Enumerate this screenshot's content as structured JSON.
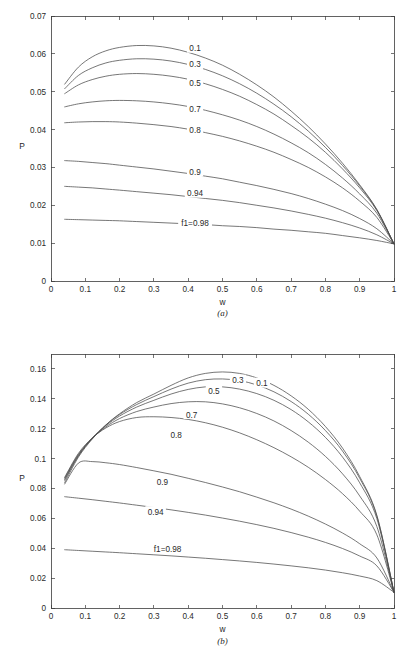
{
  "figure": {
    "panels": [
      {
        "id": "a",
        "caption": "(a)",
        "xlabel": "w",
        "ylabel": "P"
      },
      {
        "id": "b",
        "caption": "(b)",
        "xlabel": "w",
        "ylabel": "P"
      }
    ]
  },
  "chart_data": [
    {
      "type": "line",
      "panel": "(a)",
      "title": "",
      "xlabel": "w",
      "ylabel": "P",
      "xlim": [
        0,
        1
      ],
      "ylim": [
        0,
        0.07
      ],
      "xticks": [
        0,
        0.1,
        0.2,
        0.3,
        0.4,
        0.5,
        0.6,
        0.7,
        0.8,
        0.9,
        1
      ],
      "xticklabels": [
        "0",
        "0.1",
        "0.2",
        "0.3",
        "0.4",
        "0.5",
        "0.6",
        "0.7",
        "0.8",
        "0.9",
        "1"
      ],
      "yticks": [
        0,
        0.01,
        0.02,
        0.03,
        0.04,
        0.05,
        0.06,
        0.07
      ],
      "yticklabels": [
        "0",
        "0.01",
        "0.02",
        "0.03",
        "0.04",
        "0.05",
        "0.06",
        "0.07"
      ],
      "grid": false,
      "legend": "inline-curve-labels",
      "x": [
        0.04,
        0.08,
        0.12,
        0.16,
        0.2,
        0.25,
        0.3,
        0.35,
        0.4,
        0.45,
        0.5,
        0.55,
        0.6,
        0.65,
        0.7,
        0.75,
        0.8,
        0.85,
        0.9,
        0.95,
        1.0
      ],
      "series": [
        {
          "name": "0.1",
          "label": "0.1",
          "label_x": 0.42,
          "label_y": 0.0615,
          "values": [
            0.052,
            0.0565,
            0.0592,
            0.0608,
            0.0617,
            0.0622,
            0.0621,
            0.0615,
            0.0604,
            0.0589,
            0.057,
            0.0546,
            0.0518,
            0.0486,
            0.0449,
            0.0408,
            0.0362,
            0.0311,
            0.0254,
            0.0189,
            0.0098
          ]
        },
        {
          "name": "0.3",
          "label": "0.3",
          "label_x": 0.42,
          "label_y": 0.0572,
          "values": [
            0.0508,
            0.0543,
            0.0563,
            0.0576,
            0.0583,
            0.0587,
            0.0586,
            0.0581,
            0.0572,
            0.0559,
            0.0542,
            0.0521,
            0.0496,
            0.0467,
            0.0434,
            0.0396,
            0.0353,
            0.0305,
            0.0251,
            0.0188,
            0.0098
          ]
        },
        {
          "name": "0.5",
          "label": "0.5",
          "label_x": 0.42,
          "label_y": 0.0524,
          "values": [
            0.0495,
            0.0518,
            0.0532,
            0.0541,
            0.0546,
            0.0548,
            0.0546,
            0.0541,
            0.0533,
            0.0521,
            0.0506,
            0.0488,
            0.0466,
            0.0441,
            0.0411,
            0.0378,
            0.034,
            0.0296,
            0.0246,
            0.0186,
            0.0098
          ]
        },
        {
          "name": "0.7",
          "label": "0.7",
          "label_x": 0.42,
          "label_y": 0.0455,
          "values": [
            0.046,
            0.0468,
            0.0473,
            0.0476,
            0.0477,
            0.0476,
            0.0473,
            0.0468,
            0.0461,
            0.0451,
            0.0439,
            0.0425,
            0.0408,
            0.0388,
            0.0365,
            0.0339,
            0.0308,
            0.0272,
            0.023,
            0.0179,
            0.0098
          ]
        },
        {
          "name": "0.8",
          "label": "0.8",
          "label_x": 0.42,
          "label_y": 0.04,
          "values": [
            0.0418,
            0.042,
            0.0421,
            0.0421,
            0.042,
            0.0417,
            0.0413,
            0.0408,
            0.0401,
            0.0392,
            0.0382,
            0.037,
            0.0356,
            0.034,
            0.0321,
            0.03,
            0.0275,
            0.0246,
            0.0211,
            0.0168,
            0.0098
          ]
        },
        {
          "name": "0.9",
          "label": "0.9",
          "label_x": 0.42,
          "label_y": 0.0288,
          "values": [
            0.0318,
            0.0316,
            0.0313,
            0.031,
            0.0306,
            0.0301,
            0.0296,
            0.029,
            0.0284,
            0.0277,
            0.027,
            0.0261,
            0.0252,
            0.0242,
            0.0231,
            0.0218,
            0.0203,
            0.0186,
            0.0165,
            0.0138,
            0.0098
          ]
        },
        {
          "name": "0.94",
          "label": "0.94",
          "label_x": 0.42,
          "label_y": 0.0232,
          "values": [
            0.025,
            0.0248,
            0.0246,
            0.0243,
            0.024,
            0.0236,
            0.0232,
            0.0228,
            0.0223,
            0.0218,
            0.0213,
            0.0207,
            0.02,
            0.0193,
            0.0185,
            0.0176,
            0.0166,
            0.0154,
            0.014,
            0.0122,
            0.0098
          ]
        },
        {
          "name": "f1=0.98",
          "label": "f1=0.98",
          "label_x": 0.42,
          "label_y": 0.0152,
          "values": [
            0.0163,
            0.0162,
            0.0161,
            0.016,
            0.0159,
            0.0157,
            0.0155,
            0.0153,
            0.0151,
            0.0149,
            0.0146,
            0.0144,
            0.0141,
            0.0137,
            0.0134,
            0.013,
            0.0126,
            0.012,
            0.0114,
            0.0107,
            0.0098
          ]
        }
      ]
    },
    {
      "type": "line",
      "panel": "(b)",
      "title": "",
      "xlabel": "w",
      "ylabel": "P",
      "xlim": [
        0,
        1
      ],
      "ylim": [
        0,
        0.17
      ],
      "xticks": [
        0,
        0.1,
        0.2,
        0.3,
        0.4,
        0.5,
        0.6,
        0.7,
        0.8,
        0.9,
        1
      ],
      "xticklabels": [
        "0",
        "0.1",
        "0.2",
        "0.3",
        "0.4",
        "0.5",
        "0.6",
        "0.7",
        "0.8",
        "0.9",
        "1"
      ],
      "yticks": [
        0,
        0.02,
        0.04,
        0.06,
        0.08,
        0.1,
        0.12,
        0.14,
        0.16
      ],
      "yticklabels": [
        "0",
        "0.02",
        "0.04",
        "0.06",
        "0.08",
        "0.1",
        "0.12",
        "0.14",
        "0.16"
      ],
      "grid": false,
      "legend": "inline-curve-labels",
      "x": [
        0.04,
        0.08,
        0.12,
        0.16,
        0.2,
        0.25,
        0.3,
        0.35,
        0.4,
        0.45,
        0.5,
        0.55,
        0.6,
        0.65,
        0.7,
        0.75,
        0.8,
        0.85,
        0.9,
        0.95,
        1.0
      ],
      "series": [
        {
          "name": "0.1",
          "label": "0.1",
          "label_x": 0.615,
          "label_y": 0.1505,
          "values": [
            0.084,
            0.101,
            0.113,
            0.1225,
            0.13,
            0.1375,
            0.1432,
            0.149,
            0.154,
            0.157,
            0.158,
            0.157,
            0.154,
            0.149,
            0.142,
            0.133,
            0.1215,
            0.107,
            0.088,
            0.062,
            0.0105
          ]
        },
        {
          "name": "0.3",
          "label": "0.3",
          "label_x": 0.545,
          "label_y": 0.1525,
          "values": [
            0.0855,
            0.1018,
            0.1135,
            0.1225,
            0.1295,
            0.1362,
            0.1415,
            0.1465,
            0.1505,
            0.1528,
            0.1533,
            0.1522,
            0.1493,
            0.1447,
            0.1382,
            0.1297,
            0.1188,
            0.105,
            0.0868,
            0.0615,
            0.0105
          ]
        },
        {
          "name": "0.5",
          "label": "0.5",
          "label_x": 0.475,
          "label_y": 0.1455,
          "values": [
            0.0862,
            0.1022,
            0.1135,
            0.122,
            0.1285,
            0.1345,
            0.139,
            0.1432,
            0.1463,
            0.148,
            0.148,
            0.1465,
            0.1435,
            0.139,
            0.1328,
            0.1246,
            0.1142,
            0.101,
            0.0838,
            0.0598,
            0.0105
          ]
        },
        {
          "name": "0.7",
          "label": "0.7",
          "label_x": 0.41,
          "label_y": 0.1295,
          "values": [
            0.087,
            0.1028,
            0.1135,
            0.1212,
            0.1268,
            0.1315,
            0.1345,
            0.1368,
            0.138,
            0.138,
            0.1366,
            0.134,
            0.1302,
            0.1252,
            0.1188,
            0.111,
            0.1015,
            0.0898,
            0.075,
            0.0545,
            0.0105
          ]
        },
        {
          "name": "0.8",
          "label": "0.8",
          "label_x": 0.365,
          "label_y": 0.1155,
          "values": [
            0.0875,
            0.1035,
            0.1138,
            0.1205,
            0.1248,
            0.1275,
            0.128,
            0.1275,
            0.1262,
            0.124,
            0.121,
            0.1172,
            0.1126,
            0.1073,
            0.1012,
            0.0942,
            0.086,
            0.0765,
            0.0648,
            0.049,
            0.0105
          ]
        },
        {
          "name": "0.9",
          "label": "0.9",
          "label_x": 0.325,
          "label_y": 0.0845,
          "values": [
            0.083,
            0.097,
            0.098,
            0.0972,
            0.096,
            0.094,
            0.0918,
            0.0895,
            0.0868,
            0.084,
            0.081,
            0.0778,
            0.0742,
            0.0704,
            0.0662,
            0.0615,
            0.0562,
            0.0502,
            0.043,
            0.0335,
            0.0105
          ]
        },
        {
          "name": "0.94",
          "label": "0.94",
          "label_x": 0.305,
          "label_y": 0.0645,
          "values": [
            0.0745,
            0.0735,
            0.0725,
            0.0714,
            0.0703,
            0.0688,
            0.0673,
            0.0657,
            0.064,
            0.0622,
            0.0602,
            0.0581,
            0.0558,
            0.0533,
            0.0505,
            0.0474,
            0.0439,
            0.0398,
            0.0348,
            0.0282,
            0.0105
          ]
        },
        {
          "name": "f1=0.98",
          "label": "f1=0.98",
          "label_x": 0.34,
          "label_y": 0.0395,
          "values": [
            0.039,
            0.0385,
            0.038,
            0.0375,
            0.037,
            0.0363,
            0.0356,
            0.0349,
            0.0341,
            0.0333,
            0.0324,
            0.0315,
            0.0305,
            0.0294,
            0.0282,
            0.0269,
            0.0254,
            0.0236,
            0.0214,
            0.0183,
            0.0105
          ]
        }
      ]
    }
  ]
}
